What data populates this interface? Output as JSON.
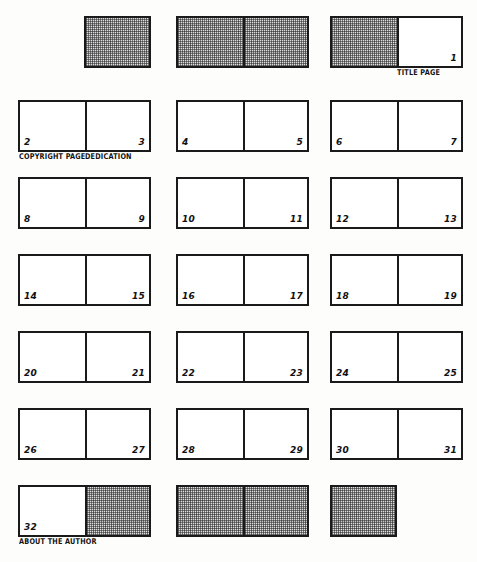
{
  "diagram": {
    "ink_color": "#1a1a1a",
    "paper_color": "#fdfdfc",
    "shaded_color": "#dedede"
  },
  "rows": [
    {
      "cells": [
        {
          "kind": "half-right",
          "pages": [
            {
              "number": "",
              "shaded": true,
              "side": "right",
              "caption": ""
            }
          ]
        },
        {
          "kind": "full",
          "pages": [
            {
              "number": "",
              "shaded": true,
              "side": "left",
              "caption": ""
            },
            {
              "number": "",
              "shaded": true,
              "side": "right",
              "caption": ""
            }
          ]
        },
        {
          "kind": "full",
          "pages": [
            {
              "number": "",
              "shaded": true,
              "side": "left",
              "caption": ""
            },
            {
              "number": "1",
              "shaded": false,
              "side": "right",
              "caption": "TITLE PAGE"
            }
          ]
        }
      ]
    },
    {
      "cells": [
        {
          "kind": "full",
          "pages": [
            {
              "number": "2",
              "shaded": false,
              "side": "left",
              "caption": "COPYRIGHT PAGE"
            },
            {
              "number": "3",
              "shaded": false,
              "side": "right",
              "caption": "DEDICATION"
            }
          ]
        },
        {
          "kind": "full",
          "pages": [
            {
              "number": "4",
              "shaded": false,
              "side": "left",
              "caption": ""
            },
            {
              "number": "5",
              "shaded": false,
              "side": "right",
              "caption": ""
            }
          ]
        },
        {
          "kind": "full",
          "pages": [
            {
              "number": "6",
              "shaded": false,
              "side": "left",
              "caption": ""
            },
            {
              "number": "7",
              "shaded": false,
              "side": "right",
              "caption": ""
            }
          ]
        }
      ]
    },
    {
      "cells": [
        {
          "kind": "full",
          "pages": [
            {
              "number": "8",
              "shaded": false,
              "side": "left",
              "caption": ""
            },
            {
              "number": "9",
              "shaded": false,
              "side": "right",
              "caption": ""
            }
          ]
        },
        {
          "kind": "full",
          "pages": [
            {
              "number": "10",
              "shaded": false,
              "side": "left",
              "caption": ""
            },
            {
              "number": "11",
              "shaded": false,
              "side": "right",
              "caption": ""
            }
          ]
        },
        {
          "kind": "full",
          "pages": [
            {
              "number": "12",
              "shaded": false,
              "side": "left",
              "caption": ""
            },
            {
              "number": "13",
              "shaded": false,
              "side": "right",
              "caption": ""
            }
          ]
        }
      ]
    },
    {
      "cells": [
        {
          "kind": "full",
          "pages": [
            {
              "number": "14",
              "shaded": false,
              "side": "left",
              "caption": ""
            },
            {
              "number": "15",
              "shaded": false,
              "side": "right",
              "caption": ""
            }
          ]
        },
        {
          "kind": "full",
          "pages": [
            {
              "number": "16",
              "shaded": false,
              "side": "left",
              "caption": ""
            },
            {
              "number": "17",
              "shaded": false,
              "side": "right",
              "caption": ""
            }
          ]
        },
        {
          "kind": "full",
          "pages": [
            {
              "number": "18",
              "shaded": false,
              "side": "left",
              "caption": ""
            },
            {
              "number": "19",
              "shaded": false,
              "side": "right",
              "caption": ""
            }
          ]
        }
      ]
    },
    {
      "cells": [
        {
          "kind": "full",
          "pages": [
            {
              "number": "20",
              "shaded": false,
              "side": "left",
              "caption": ""
            },
            {
              "number": "21",
              "shaded": false,
              "side": "right",
              "caption": ""
            }
          ]
        },
        {
          "kind": "full",
          "pages": [
            {
              "number": "22",
              "shaded": false,
              "side": "left",
              "caption": ""
            },
            {
              "number": "23",
              "shaded": false,
              "side": "right",
              "caption": ""
            }
          ]
        },
        {
          "kind": "full",
          "pages": [
            {
              "number": "24",
              "shaded": false,
              "side": "left",
              "caption": ""
            },
            {
              "number": "25",
              "shaded": false,
              "side": "right",
              "caption": ""
            }
          ]
        }
      ]
    },
    {
      "cells": [
        {
          "kind": "full",
          "pages": [
            {
              "number": "26",
              "shaded": false,
              "side": "left",
              "caption": ""
            },
            {
              "number": "27",
              "shaded": false,
              "side": "right",
              "caption": ""
            }
          ]
        },
        {
          "kind": "full",
          "pages": [
            {
              "number": "28",
              "shaded": false,
              "side": "left",
              "caption": ""
            },
            {
              "number": "29",
              "shaded": false,
              "side": "right",
              "caption": ""
            }
          ]
        },
        {
          "kind": "full",
          "pages": [
            {
              "number": "30",
              "shaded": false,
              "side": "left",
              "caption": ""
            },
            {
              "number": "31",
              "shaded": false,
              "side": "right",
              "caption": ""
            }
          ]
        }
      ]
    },
    {
      "cells": [
        {
          "kind": "full",
          "pages": [
            {
              "number": "32",
              "shaded": false,
              "side": "left",
              "caption": "ABOUT THE AUTHOR"
            },
            {
              "number": "",
              "shaded": true,
              "side": "right",
              "caption": ""
            }
          ]
        },
        {
          "kind": "full",
          "pages": [
            {
              "number": "",
              "shaded": true,
              "side": "left",
              "caption": ""
            },
            {
              "number": "",
              "shaded": true,
              "side": "right",
              "caption": ""
            }
          ]
        },
        {
          "kind": "half-left",
          "pages": [
            {
              "number": "",
              "shaded": true,
              "side": "left",
              "caption": ""
            }
          ]
        }
      ]
    }
  ]
}
